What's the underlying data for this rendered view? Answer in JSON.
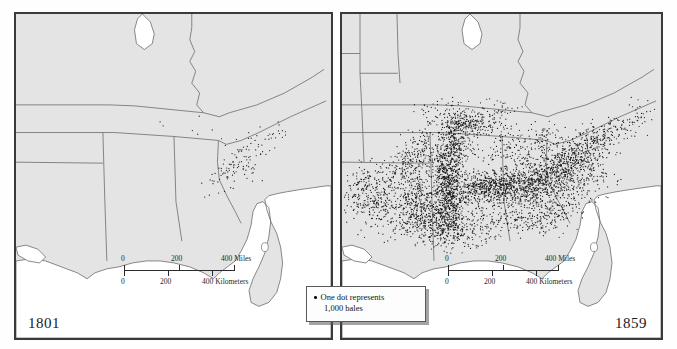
{
  "figure": {
    "kind": "historical-dot-density-map-pair"
  },
  "panels": [
    {
      "id": "left",
      "year_label": "1801",
      "scale": {
        "miles_ticks": [
          "0",
          "200",
          "400"
        ],
        "miles_unit": "400 Miles",
        "km_ticks": [
          "0",
          "200",
          "400"
        ],
        "km_unit": "400 Kilometers",
        "tick_top_0": "0",
        "tick_top_200": "200",
        "tick_top_400": "400 Miles",
        "tick_bot_0": "0",
        "tick_bot_200": "200",
        "tick_bot_400": "400 Kilometers"
      }
    },
    {
      "id": "right",
      "year_label": "1859",
      "scale": {
        "tick_top_0": "0",
        "tick_top_200": "200",
        "tick_top_400": "400 Miles",
        "tick_bot_0": "0",
        "tick_bot_200": "200",
        "tick_bot_400": "400 Kilometers"
      }
    }
  ],
  "legend": {
    "line1": "One dot represents",
    "line2": "1,000 bales",
    "dot_icon": "legend-dot-icon"
  },
  "colors": {
    "land": "#e4e4e4",
    "water": "#ffffff",
    "border_line": "#6b6b6b",
    "frame": "#3a3a3a",
    "dot": "#1a1a1a",
    "page": "#fefefe"
  },
  "chart_data": {
    "type": "scatter",
    "legend_note": "One dot represents 1,000 bales",
    "xlabel": "",
    "ylabel": "",
    "panels": [
      {
        "name": "1801",
        "dot_unit_bales": 1000,
        "approx_dot_count": 120,
        "regions": [
          {
            "name": "South Carolina upcountry",
            "density": "high",
            "share": 0.55
          },
          {
            "name": "Eastern Georgia",
            "density": "medium",
            "share": 0.2
          },
          {
            "name": "Coastal South Carolina / Sea Islands",
            "density": "medium",
            "share": 0.12
          },
          {
            "name": "North Carolina southeast",
            "density": "low",
            "share": 0.08
          },
          {
            "name": "Tennessee",
            "density": "very low",
            "share": 0.03
          },
          {
            "name": "Mississippi / Louisiana / Texas",
            "density": "none",
            "share": 0.02
          }
        ]
      },
      {
        "name": "1859",
        "dot_unit_bales": 1000,
        "approx_dot_count": 4500,
        "regions": [
          {
            "name": "Mississippi River Valley (Delta)",
            "density": "very high",
            "share": 0.24
          },
          {
            "name": "Alabama Black Belt",
            "density": "very high",
            "share": 0.2
          },
          {
            "name": "Central Georgia",
            "density": "high",
            "share": 0.15
          },
          {
            "name": "Louisiana (Red River / Bayou)",
            "density": "high",
            "share": 0.12
          },
          {
            "name": "East Texas",
            "density": "medium",
            "share": 0.09
          },
          {
            "name": "Arkansas",
            "density": "medium",
            "share": 0.07
          },
          {
            "name": "Tennessee west",
            "density": "medium",
            "share": 0.06
          },
          {
            "name": "South Carolina upcountry",
            "density": "medium",
            "share": 0.05
          },
          {
            "name": "North Carolina southeast",
            "density": "low",
            "share": 0.02
          }
        ]
      }
    ]
  }
}
